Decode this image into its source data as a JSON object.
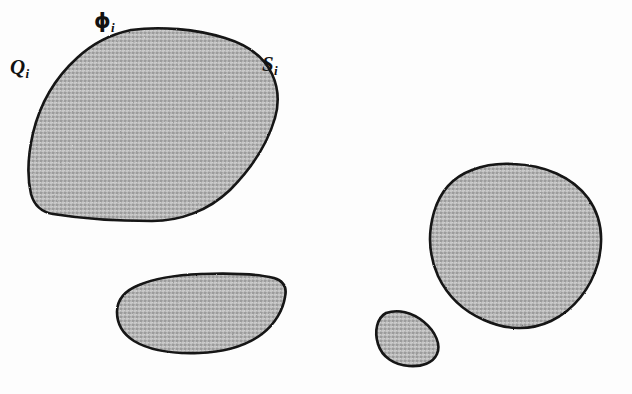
{
  "figure": {
    "background_color": "#fdfdfd",
    "outline_color": "#141414",
    "fill_color": "#b2b2b2",
    "fill_texture": "dithered-gray-halftone",
    "labels": [
      {
        "id": "Q",
        "base": "Q",
        "subscript": "i",
        "style": "italic-serif-bold",
        "x": 10,
        "y": 57
      },
      {
        "id": "phi",
        "base": "ϕ",
        "subscript": "i",
        "style": "upright-bold-phi",
        "x": 94,
        "y": 11
      },
      {
        "id": "S",
        "base": "S",
        "subscript": "i",
        "style": "italic-serif-bold",
        "x": 262,
        "y": 54
      }
    ],
    "shapes": [
      {
        "name": "region-upper-left",
        "description": "Large rounded quadrilateral blob at upper left, labelled Q_i, phi_i and S_i",
        "bbox": [
          28,
          28,
          278,
          222
        ],
        "path": "M 131 30 C 160 26 196 29 225 38 C 248 45 264 57 272 74 C 279 89 279 104 275 118 C 268 142 252 168 230 190 C 208 211 180 221 152 221 C 120 221 84 219 53 214 C 41 212 34 205 31 194 C 27 177 28 155 33 133 C 40 104 55 78 77 58 C 93 43 112 34 131 30 Z"
      },
      {
        "name": "region-lower-middle",
        "description": "Flattened lens-shaped blob at lower middle-left",
        "bbox": [
          116,
          271,
          288,
          355
        ],
        "path": "M 201 274 C 230 273 258 274 274 278 C 284 281 287 288 285 297 C 283 310 275 324 262 334 C 246 346 224 352 199 353 C 173 354 149 350 134 341 C 123 334 117 324 117 312 C 117 300 124 291 139 285 C 155 278 178 275 201 274 Z"
      },
      {
        "name": "region-small-teardrop",
        "description": "Small teardrop / leaf-shaped blob near bottom centre-right",
        "bbox": [
          376,
          308,
          442,
          368
        ],
        "path": "M 386 313 C 398 309 412 312 424 322 C 436 332 441 345 437 354 C 433 363 422 367 409 366 C 394 365 382 357 378 344 C 374 331 377 318 386 313 Z"
      },
      {
        "name": "region-right",
        "description": "Large ovoid blob at right side",
        "bbox": [
          428,
          162,
          602,
          330
        ],
        "path": "M 513 164 C 545 165 572 177 588 198 C 601 216 604 239 598 263 C 591 288 574 310 551 321 C 530 331 506 330 484 320 C 463 311 447 295 438 276 C 429 256 428 233 434 212 C 440 192 453 177 472 170 C 485 165 499 163 513 164 Z"
      }
    ]
  }
}
